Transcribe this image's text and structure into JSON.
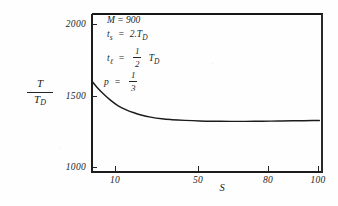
{
  "chart_data": {
    "type": "line",
    "title": "",
    "xlabel": "S",
    "ylabel": "T / T_D",
    "xscale": "log",
    "xlim": [
      7,
      105
    ],
    "ylim": [
      1000,
      2050
    ],
    "grid": false,
    "legend": null,
    "xticks": [
      10,
      50,
      80,
      100
    ],
    "xticklabels": [
      "10",
      "50",
      "80",
      "100"
    ],
    "yticks": [
      1000,
      1500,
      2000
    ],
    "yticklabels": [
      "1000",
      "1500",
      "2000"
    ],
    "series": [
      {
        "name": "T/T_D vs S",
        "x": [
          7,
          7.4,
          8,
          8.7,
          9.5,
          10.5,
          11.5,
          12.5,
          14,
          16,
          18,
          21,
          25,
          30,
          36,
          43,
          50,
          58,
          66,
          75,
          85,
          95,
          103
        ],
        "y": [
          1600,
          1560,
          1512,
          1468,
          1430,
          1400,
          1379,
          1364,
          1349,
          1337,
          1331,
          1326,
          1322,
          1320,
          1319,
          1319,
          1320,
          1321,
          1322,
          1323,
          1324,
          1325,
          1325
        ]
      }
    ],
    "annotations": [
      {
        "id": "m",
        "text": "M  =  900"
      },
      {
        "id": "ts",
        "lhs": "t",
        "lhs_sub": "s",
        "rel": "=",
        "rhs": "2.T",
        "rhs_sub": "D"
      },
      {
        "id": "tl",
        "lhs": "t",
        "lhs_sub": "ℓ",
        "rel": "=",
        "frac_num": "1",
        "frac_den": "2",
        "rhs": "T",
        "rhs_sub": "D"
      },
      {
        "id": "p",
        "lhs": "p",
        "rel": "=",
        "frac_num": "1",
        "frac_den": "3"
      }
    ]
  },
  "axes": {
    "ytitle_num": "T",
    "ytitle_den_main": "T",
    "ytitle_den_sub": "D",
    "xtitle": "S"
  }
}
